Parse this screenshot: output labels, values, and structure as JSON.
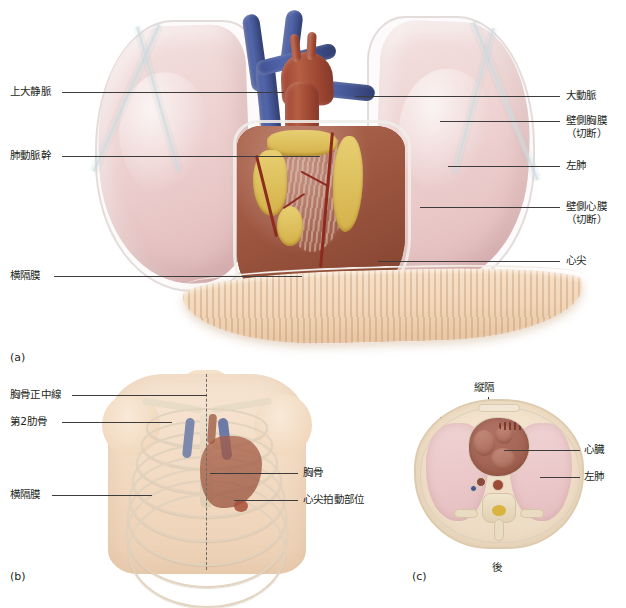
{
  "figure": {
    "panels": [
      "a",
      "b",
      "c"
    ]
  },
  "panel_a": {
    "tag": "(a)",
    "labels_left": [
      {
        "name": "superior-vena-cava",
        "text": "上大静脈",
        "y": 88
      },
      {
        "name": "pulmonary-trunk",
        "text": "肺動脈幹",
        "y": 152
      },
      {
        "name": "diaphragm",
        "text": "横隔膜",
        "y": 272
      }
    ],
    "labels_right": [
      {
        "name": "aorta",
        "text": "大動脈",
        "sub": "",
        "y": 92
      },
      {
        "name": "parietal-pleura-cut",
        "text": "壁側胸膜",
        "sub": "（切断）",
        "y": 117
      },
      {
        "name": "left-lung",
        "text": "左肺",
        "sub": "",
        "y": 162
      },
      {
        "name": "parietal-pericardium-cut",
        "text": "壁側心膜",
        "sub": "（切断）",
        "y": 203
      },
      {
        "name": "cardiac-apex",
        "text": "心尖",
        "sub": "",
        "y": 257
      }
    ]
  },
  "panel_b": {
    "tag": "(b)",
    "labels_left": [
      {
        "name": "midsternal-line",
        "text": "胸骨正中線",
        "y": 392
      },
      {
        "name": "second-rib",
        "text": "第2肋骨",
        "y": 419
      },
      {
        "name": "diaphragm",
        "text": "横隔膜",
        "y": 492
      }
    ],
    "labels_right": [
      {
        "name": "sternum",
        "text": "胸骨",
        "y": 470
      },
      {
        "name": "point-of-maximal-impulse",
        "text": "心尖拍動部位",
        "y": 497
      }
    ]
  },
  "panel_c": {
    "tag": "(c)",
    "label_top": {
      "name": "mediastinum",
      "text": "縦隔"
    },
    "labels_right": [
      {
        "name": "heart",
        "text": "心臓",
        "y": 446
      },
      {
        "name": "left-lung",
        "text": "左肺",
        "y": 473
      }
    ],
    "label_bottom": {
      "name": "posterior",
      "text": "後"
    }
  },
  "colors": {
    "lung": "#eed3d2",
    "heart_muscle": "#9d5640",
    "vein_blue": "#41528f",
    "artery_red": "#9e4330",
    "fat_yellow": "#d9b953",
    "diaphragm_tan": "#f0d3b5",
    "skin": "#f3dcc5",
    "bone": "#e5d5bb",
    "leader_line": "#3c3c3c",
    "text": "#231f20"
  }
}
